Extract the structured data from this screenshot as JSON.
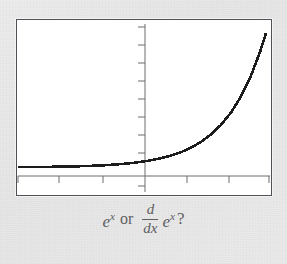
{
  "figure": {
    "background_color": "#e9e9e9",
    "plot_background": "#ffffff",
    "frame_color": "#4e5257",
    "curve_color": "#1c1c1c",
    "axis_color": "#6d6d6d",
    "caption_color": "#5e5e62"
  },
  "caption": {
    "first_expression_base": "e",
    "first_expression_exponent": "x",
    "conjunction": "or",
    "derivative_numerator": "d",
    "derivative_denominator": "dx",
    "second_expression_base": "e",
    "second_expression_exponent": "x",
    "question_mark": "?",
    "plain_text": "e^x  or  d/dx e^x ?"
  },
  "chart_data": {
    "type": "line",
    "title": "",
    "xlabel": "",
    "ylabel": "",
    "function": "y = e^x",
    "grid": false,
    "legend": null,
    "xlim": [
      -4.2,
      2.25
    ],
    "ylim": [
      -0.55,
      9.2
    ],
    "x_axis_ticks": [
      -4,
      -3,
      -2,
      -1,
      0,
      1,
      2
    ],
    "y_axis_ticks": [
      1,
      2,
      3,
      4,
      5,
      6,
      7,
      8
    ],
    "x": [
      -4.2,
      -4,
      -3.75,
      -3.5,
      -3.25,
      -3,
      -2.75,
      -2.5,
      -2.25,
      -2,
      -1.75,
      -1.5,
      -1.25,
      -1,
      -0.75,
      -0.5,
      -0.25,
      0,
      0.25,
      0.5,
      0.75,
      1,
      1.25,
      1.5,
      1.75,
      2,
      2.15
    ],
    "y": [
      0.015,
      0.018,
      0.024,
      0.03,
      0.039,
      0.05,
      0.064,
      0.082,
      0.105,
      0.135,
      0.174,
      0.223,
      0.287,
      0.368,
      0.472,
      0.607,
      0.779,
      1.0,
      1.284,
      1.649,
      2.117,
      2.718,
      3.49,
      4.482,
      5.755,
      7.389,
      8.58
    ]
  }
}
